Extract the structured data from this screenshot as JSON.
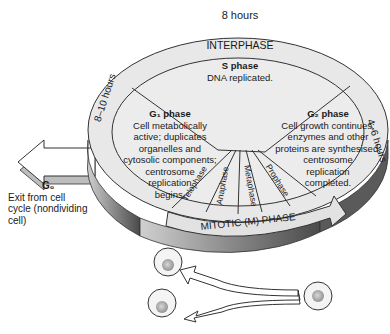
{
  "diagram": {
    "top_duration": "8 hours",
    "interphase_label": "INTERPHASE",
    "mitotic_label": "MITOTIC (M) PHASE",
    "left_duration": "8–10 hours",
    "right_duration": "4–6 hours",
    "s_phase": {
      "title": "S phase",
      "desc": "DNA replicated."
    },
    "g1_phase": {
      "title": "G₁ phase",
      "lines": [
        "Cell metabolically",
        "active; duplicates",
        "organelles and",
        "cytosolic components;",
        "centrosome",
        "replication",
        "begins."
      ]
    },
    "g2_phase": {
      "title": "G₂ phase",
      "lines": [
        "Cell growth continues;",
        "enzymes and other",
        "proteins are synthesised;",
        "centrosome",
        "replication",
        "completed."
      ]
    },
    "mitotic_stages": [
      "Telophase",
      "Anaphase",
      "Metaphase",
      "Prophase"
    ],
    "g0": {
      "title": "G₀",
      "lines": [
        "Exit from cell",
        "cycle (nondividing",
        "cell)"
      ]
    },
    "colors": {
      "disc_face": "#e8e8e8",
      "disc_edge": "#7a7a7a",
      "outline": "#333333",
      "cell_fill": "#f2f2f2",
      "nucleus": "#a8a8a8"
    }
  }
}
